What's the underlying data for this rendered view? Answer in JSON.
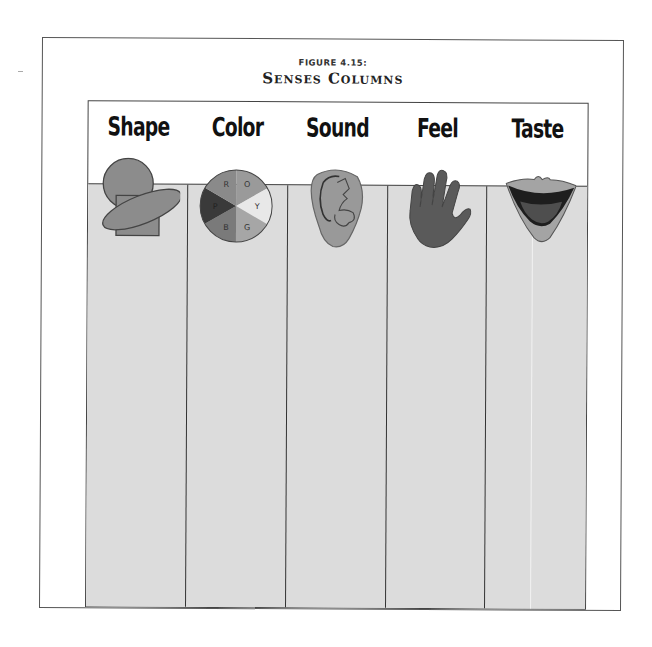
{
  "figure": {
    "label": "FIGURE 4.15:",
    "title": "Senses Columns"
  },
  "columns": [
    {
      "label": "Shape",
      "icon": "shapes-icon"
    },
    {
      "label": "Color",
      "icon": "color-wheel-icon"
    },
    {
      "label": "Sound",
      "icon": "ear-icon"
    },
    {
      "label": "Feel",
      "icon": "hand-icon"
    },
    {
      "label": "Taste",
      "icon": "mouth-icon"
    }
  ],
  "color_wheel": {
    "segments": [
      {
        "letter": "R",
        "color": "#8a8a8a"
      },
      {
        "letter": "O",
        "color": "#9a9a9a"
      },
      {
        "letter": "Y",
        "color": "#e8e8e8"
      },
      {
        "letter": "G",
        "color": "#a6a6a6"
      },
      {
        "letter": "B",
        "color": "#7a7a7a"
      },
      {
        "letter": "P",
        "color": "#3a3a3a"
      }
    ]
  },
  "colors": {
    "column_fill": "#dcdcdc",
    "border": "#444444",
    "icon_mid": "#8c8c8c",
    "icon_dark": "#555555"
  }
}
